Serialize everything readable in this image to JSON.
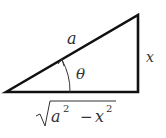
{
  "diagram": {
    "type": "right-triangle",
    "hypotenuse_label": "a",
    "opposite_label": "x",
    "angle_label": "θ",
    "adjacent_label": {
      "radicand_a": "a",
      "exp_a": "2",
      "minus": "−",
      "radicand_x": "x",
      "exp_x": "2"
    },
    "colors": {
      "stroke": "#111111",
      "text": "#333333"
    }
  }
}
